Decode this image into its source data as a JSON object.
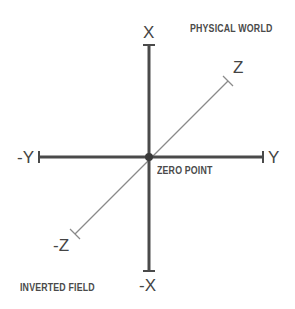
{
  "diagram": {
    "axes": {
      "x_pos": "X",
      "x_neg": "-X",
      "y_pos": "Y",
      "y_neg": "-Y",
      "z_pos": "Z",
      "z_neg": "-Z"
    },
    "origin_label": "ZERO POINT",
    "region_labels": {
      "top_right": "PHYSICAL WORLD",
      "bottom_left": "INVERTED FIELD"
    },
    "colors": {
      "axis_main": "#444444",
      "axis_z": "#888888",
      "text": "#444444"
    }
  }
}
